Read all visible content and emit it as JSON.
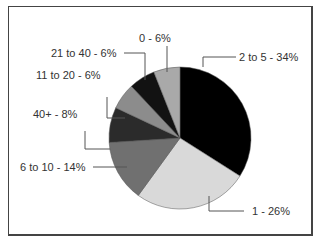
{
  "chart_data": {
    "type": "pie",
    "title": "",
    "start_angle": "12 o'clock",
    "direction": "clockwise",
    "slices": [
      {
        "label": "2 to 5",
        "value": 34,
        "display": "2 to 5 - 34%",
        "color": "#000000"
      },
      {
        "label": "1",
        "value": 26,
        "display": "1 - 26%",
        "color": "#d9d9d9"
      },
      {
        "label": "6 to 10",
        "value": 14,
        "display": "6 to 10 - 14%",
        "color": "#707070"
      },
      {
        "label": "40+",
        "value": 8,
        "display": "40+ - 8%",
        "color": "#2b2b2b"
      },
      {
        "label": "11 to 20",
        "value": 6,
        "display": "11 to 20 - 6%",
        "color": "#8c8c8c"
      },
      {
        "label": "21 to 40",
        "value": 6,
        "display": "21 to 40 - 6%",
        "color": "#121212"
      },
      {
        "label": "0",
        "value": 6,
        "display": "0 - 6%",
        "color": "#a9a9a9"
      }
    ],
    "legend": "none (leader-line labels)"
  },
  "labels": {
    "s0": "2 to 5 - 34%",
    "s1": "1 - 26%",
    "s2": "6 to 10 - 14%",
    "s3": "40+ - 8%",
    "s4": "11 to 20 - 6%",
    "s5": "21 to 40 - 6%",
    "s6": "0 - 6%"
  }
}
